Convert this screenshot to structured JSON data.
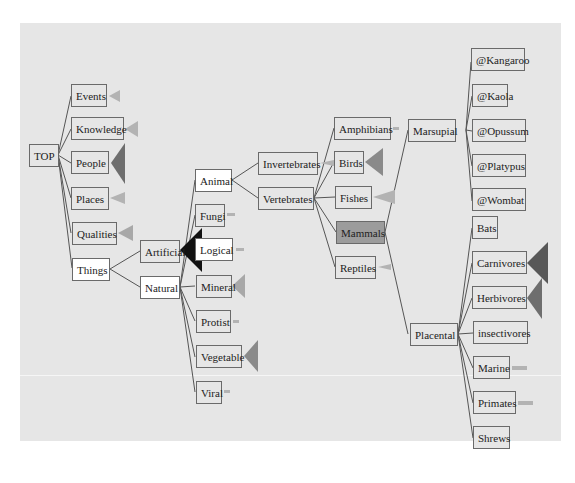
{
  "diagram": {
    "colors": {
      "panel": "#e6e6e6",
      "edge": "#555555",
      "marker_light": "#b3b3b3",
      "marker_mid": "#8a8a8a",
      "marker_dark": "#585858",
      "marker_black": "#111111",
      "selected": "#9c9c9c"
    },
    "nodes": {
      "top": "TOP",
      "events": "Events",
      "knowledge": "Knowledge",
      "people": "People",
      "places": "Places",
      "qualities": "Qualities",
      "things": "Things",
      "artificial": "Artificial",
      "natural": "Natural",
      "animal": "Animal",
      "fungi": "Fungi",
      "logical": "Logical",
      "mineral": "Mineral",
      "protist": "Protist",
      "vegetable": "Vegetable",
      "viral": "Viral",
      "invertebrates": "Invertebrates",
      "vertebrates": "Vertebrates",
      "amphibians": "Amphibians",
      "birds": "Birds",
      "fishes": "Fishes",
      "mammals": "Mammals",
      "reptiles": "Reptiles",
      "marsupial": "Marsupial",
      "placental": "Placental",
      "kangaroo": "@Kangaroo",
      "kaola": "@Kaola",
      "opussum": "@Opussum",
      "platypus": "@Platypus",
      "wombat": "@Wombat",
      "bats": "Bats",
      "carnivores": "Carnivores",
      "herbivores": "Herbivores",
      "insectivores": "insectivores",
      "marine": "Marine",
      "primates": "Primates",
      "shrews": "Shrews"
    },
    "selected_node": "Mammals"
  }
}
